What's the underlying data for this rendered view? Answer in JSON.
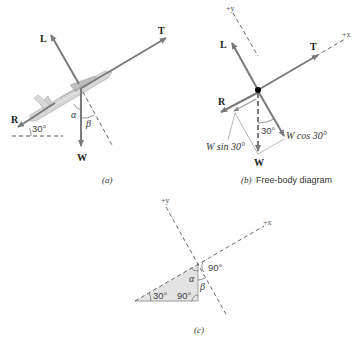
{
  "figure": {
    "panel_a": {
      "caption": "(a)",
      "labels": {
        "lift": "L",
        "thrust": "T",
        "drag": "R",
        "weight": "W",
        "angle_30": "30°",
        "alpha": "α",
        "beta": "β"
      }
    },
    "panel_b": {
      "caption_letter": "(b)",
      "caption_text": "Free-body diagram",
      "labels": {
        "plus_y": "+y",
        "plus_x": "+x",
        "lift": "L",
        "thrust": "T",
        "drag": "R",
        "weight": "W",
        "angle_30": "30°",
        "w_cos": "W cos 30°",
        "w_sin": "W sin 30°"
      }
    },
    "panel_c": {
      "caption": "(c)",
      "labels": {
        "plus_y": "+y",
        "plus_x": "+x",
        "angle_90_top": "90°",
        "angle_30": "30°",
        "angle_90_bottom": "90°",
        "alpha": "α",
        "beta": "β"
      }
    },
    "colors": {
      "arrow": "#7a7a7a",
      "dashed": "#555555",
      "triangle_fill": "#e3e3e3",
      "dot": "#000000",
      "plane": "#c8c8c8"
    }
  }
}
